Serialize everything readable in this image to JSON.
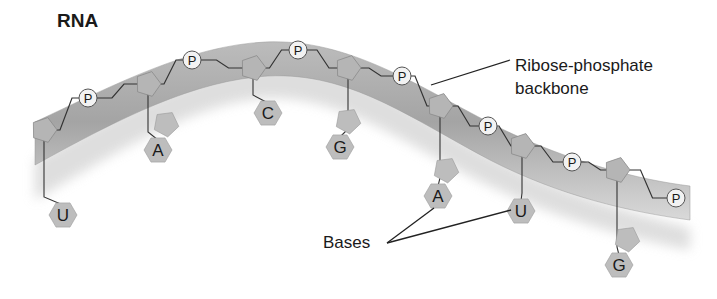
{
  "title": "RNA",
  "labels": {
    "backbone_line1": "Ribose-phosphate",
    "backbone_line2": "backbone",
    "bases": "Bases"
  },
  "phosphate_symbol": "P",
  "phosphates": [
    {
      "x": 88,
      "y": 98
    },
    {
      "x": 192,
      "y": 60
    },
    {
      "x": 298,
      "y": 50
    },
    {
      "x": 402,
      "y": 76
    },
    {
      "x": 488,
      "y": 126
    },
    {
      "x": 572,
      "y": 162
    },
    {
      "x": 676,
      "y": 198
    }
  ],
  "nucleotides": [
    {
      "base": "U",
      "type": "pyrimidine",
      "sugar": {
        "x": 44,
        "y": 130
      },
      "base_pos": {
        "x": 63,
        "y": 215
      }
    },
    {
      "base": "A",
      "type": "purine",
      "sugar": {
        "x": 148,
        "y": 84
      },
      "base_pos": {
        "x": 158,
        "y": 150
      }
    },
    {
      "base": "C",
      "type": "pyrimidine",
      "sugar": {
        "x": 253,
        "y": 68
      },
      "base_pos": {
        "x": 268,
        "y": 113
      }
    },
    {
      "base": "G",
      "type": "purine",
      "sugar": {
        "x": 348,
        "y": 68
      },
      "base_pos": {
        "x": 340,
        "y": 147
      }
    },
    {
      "base": "A",
      "type": "purine",
      "sugar": {
        "x": 440,
        "y": 106
      },
      "base_pos": {
        "x": 438,
        "y": 196
      }
    },
    {
      "base": "U",
      "type": "pyrimidine",
      "sugar": {
        "x": 522,
        "y": 146
      },
      "base_pos": {
        "x": 521,
        "y": 211
      }
    },
    {
      "base": "G",
      "type": "purine",
      "sugar": {
        "x": 617,
        "y": 170
      },
      "base_pos": {
        "x": 619,
        "y": 265
      }
    }
  ],
  "colors": {
    "backbone_band": "#a8a8a8",
    "backbone_shadow": "#cfcfcf",
    "base_fill": "#bdbdbd",
    "sugar_fill": "#b5b5b5",
    "phosphate_fill": "#f2f2f2",
    "line": "#333333",
    "text": "#1a1a1a"
  }
}
